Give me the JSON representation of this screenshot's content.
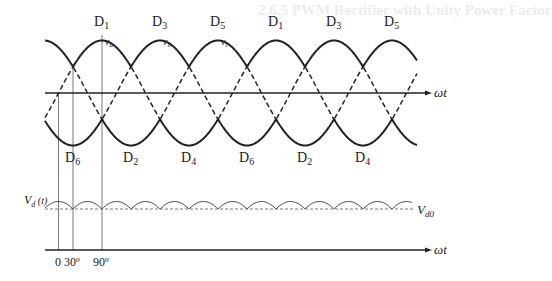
{
  "diagram": {
    "phase_voltages": {
      "phases": [
        "v_a",
        "v_b",
        "v_c"
      ],
      "phase_labels": {
        "a": "v",
        "a_sub": "a",
        "b": "v",
        "b_sub": "b",
        "c": "v",
        "c_sub": "c"
      },
      "upper_diodes": [
        {
          "label": "D",
          "sub": "1"
        },
        {
          "label": "D",
          "sub": "3"
        },
        {
          "label": "D",
          "sub": "5"
        },
        {
          "label": "D",
          "sub": "1"
        },
        {
          "label": "D",
          "sub": "3"
        },
        {
          "label": "D",
          "sub": "5"
        }
      ],
      "lower_diodes": [
        {
          "label": "D",
          "sub": "6"
        },
        {
          "label": "D",
          "sub": "2"
        },
        {
          "label": "D",
          "sub": "4"
        },
        {
          "label": "D",
          "sub": "6"
        },
        {
          "label": "D",
          "sub": "2"
        },
        {
          "label": "D",
          "sub": "4"
        }
      ],
      "x_axis_label": "ωt"
    },
    "output_voltage": {
      "label": "V",
      "label_sub": "d",
      "label_suffix": " (t)",
      "average_label": "V",
      "average_sub": "d0",
      "x_axis_label": "ωt"
    },
    "angle_markers": [
      "0",
      "30º",
      "90º"
    ],
    "colors": {
      "line": "#222222",
      "guide": "#555555",
      "background": "#ffffff"
    }
  },
  "background_text": {
    "heading": "2.6.5  PWM Rectifier with Unity Power Factor"
  }
}
